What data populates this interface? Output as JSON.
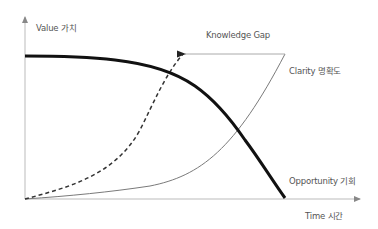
{
  "diagram": {
    "axes": {
      "y_label": "Value 가치",
      "x_label": "Time 시간"
    },
    "curves": [
      {
        "id": "opportunity",
        "label": "Opportunity 기회",
        "style": "thick solid",
        "color": "#111111",
        "trend": "flat high then steep decline to zero"
      },
      {
        "id": "clarity",
        "label": "Clarity 명확도",
        "style": "thin solid",
        "color": "#777777",
        "trend": "slow then accelerating rise"
      },
      {
        "id": "knowledge",
        "label": "",
        "style": "dashed",
        "color": "#333333",
        "trend": "early exponential rise"
      }
    ],
    "annotation": {
      "label": "Knowledge Gap",
      "style": "horizontal arrow from clarity endpoint to dashed curve endpoint",
      "color": "#aaaaaa"
    }
  },
  "colors": {
    "axis": "#bbbbbb",
    "text": "#555555",
    "opportunity": "#111111",
    "clarity": "#7a7a7a",
    "dashed": "#333333",
    "gap_arrow": "#aaaaaa"
  }
}
